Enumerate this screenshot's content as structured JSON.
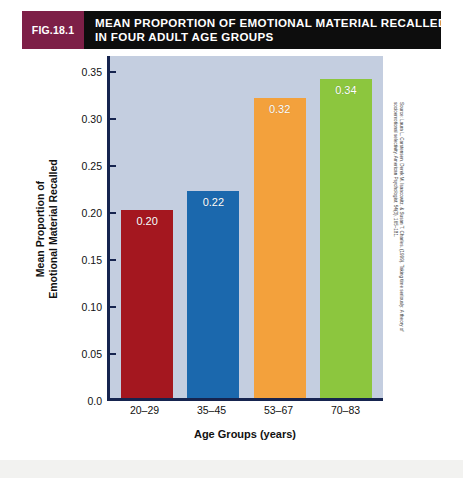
{
  "figure": {
    "badge_label": "FIG.18.1",
    "title_line_1": "MEAN PROPORTION OF EMOTIONAL MATERIAL RECALLED",
    "title_line_2": "IN FOUR ADULT AGE GROUPS",
    "badge_color": "#7d1f47",
    "header_color": "#0d0d0d"
  },
  "source": {
    "line_1": "Source: Laura L. Carstensen, Derek M. Isaacowitz, & Susan T. Charles. (1999). Taking time seriously: A theory of",
    "line_2": "socioemotional selectivity. American Psychologist, 54(3), 165–181."
  },
  "axis": {
    "y_title_line_1": "Mean Proportion of",
    "y_title_line_2": "Emotional Material Recalled",
    "x_title": "Age Groups (years)"
  },
  "chart_data": {
    "type": "bar",
    "title": "MEAN PROPORTION OF EMOTIONAL MATERIAL RECALLED IN FOUR ADULT AGE GROUPS",
    "xlabel": "Age Groups (years)",
    "ylabel": "Mean Proportion of Emotional Material Recalled",
    "categories": [
      "20–29",
      "35–45",
      "53–67",
      "70–83"
    ],
    "values": [
      0.2,
      0.22,
      0.32,
      0.34
    ],
    "value_labels": [
      "0.20",
      "0.22",
      "0.32",
      "0.34"
    ],
    "bar_colors": [
      "#a4171f",
      "#1b68ad",
      "#f3a13c",
      "#8cc63e"
    ],
    "ylim": [
      0.0,
      0.3675
    ],
    "yticks": [
      0.0,
      0.05,
      0.1,
      0.15,
      0.2,
      0.25,
      0.3,
      0.35
    ],
    "ytick_labels": [
      "0.0",
      "0.05",
      "0.10",
      "0.15",
      "0.20",
      "0.25",
      "0.30",
      "0.35"
    ],
    "grid": false,
    "legend": "none",
    "plot_background": "#c4cee0",
    "axis_color": "#16244f"
  }
}
